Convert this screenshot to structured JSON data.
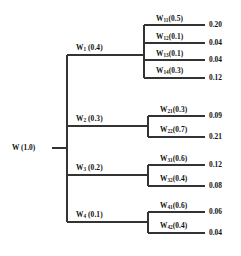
{
  "figure": {
    "type": "hierarchy-tree-diagram",
    "line_color": "#333333",
    "text_color": "#111111",
    "background": "#ffffff"
  },
  "root": {
    "name": "W",
    "weight": "1.0",
    "label": "W (1.0)"
  },
  "branches": [
    {
      "name": "W",
      "subscript": "1",
      "weight": "0.4",
      "label_weight": "(0.4)",
      "children": [
        {
          "name": "W",
          "subscript": "11",
          "weight": "(0.5)",
          "value": "0.20"
        },
        {
          "name": "W",
          "subscript": "12",
          "weight": "(0.1)",
          "value": "0.04"
        },
        {
          "name": "W",
          "subscript": "13",
          "weight": "(0.1)",
          "value": "0.04"
        },
        {
          "name": "W",
          "subscript": "14",
          "weight": "(0.3)",
          "value": "0.12"
        }
      ]
    },
    {
      "name": "W",
      "subscript": "2",
      "weight": "0.3",
      "label_weight": "(0.3)",
      "children": [
        {
          "name": "W",
          "subscript": "21",
          "weight": "(0.3)",
          "value": "0.09"
        },
        {
          "name": "W",
          "subscript": "22",
          "weight": "(0.7)",
          "value": "0.21"
        }
      ]
    },
    {
      "name": "W",
      "subscript": "3",
      "weight": "0.2",
      "label_weight": "(0.2)",
      "children": [
        {
          "name": "W",
          "subscript": "31",
          "weight": "(0.6)",
          "value": "0.12"
        },
        {
          "name": "W",
          "subscript": "32",
          "weight": "(0.4)",
          "value": "0.08"
        }
      ]
    },
    {
      "name": "W",
      "subscript": "4",
      "weight": "0.1",
      "label_weight": "(0.1)",
      "children": [
        {
          "name": "W",
          "subscript": "41",
          "weight": "(0.6)",
          "value": "0.06"
        },
        {
          "name": "W",
          "subscript": "42",
          "weight": "(0.4)",
          "value": "0.04"
        }
      ]
    }
  ]
}
